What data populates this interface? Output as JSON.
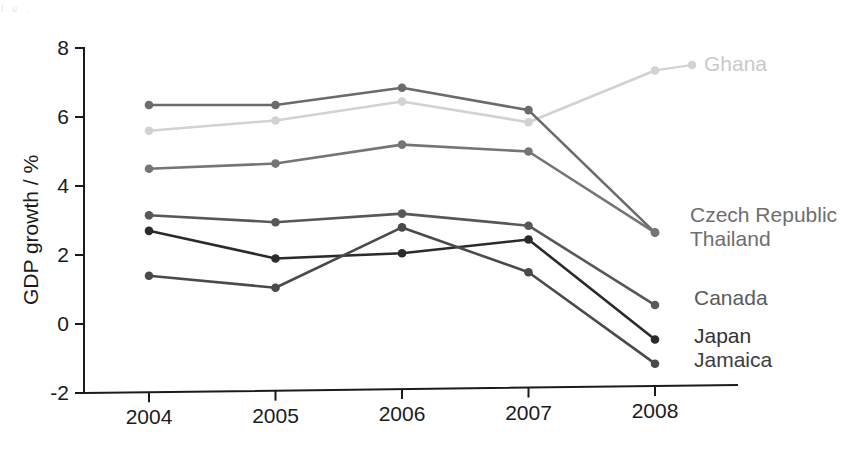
{
  "figure": {
    "background_color": "#ffffff",
    "top_artifact_text": "f    g                                                    ."
  },
  "axes": {
    "y_axis_title": "GDP growth / %",
    "y_ticks": [
      "8",
      "6",
      "4",
      "2",
      "0",
      "-2"
    ],
    "x_ticks": [
      "2004",
      "2005",
      "2006",
      "2007",
      "2008"
    ],
    "axis_color": "#1b1b1b"
  },
  "labels": [
    {
      "name": "Ghana",
      "text": "Ghana",
      "color": "#c9c9c9"
    },
    {
      "name": "Czech Republic",
      "text": "Czech Republic",
      "color": "#6e6e6e"
    },
    {
      "name": "Thailand",
      "text": "Thailand",
      "color": "#6e6e6e"
    },
    {
      "name": "Canada",
      "text": "Canada",
      "color": "#5a5a5a"
    },
    {
      "name": "Japan",
      "text": "Japan",
      "color": "#333333"
    },
    {
      "name": "Jamaica",
      "text": "Jamaica",
      "color": "#3d3d3d"
    }
  ],
  "chart_data": {
    "type": "line",
    "title": "",
    "xlabel": "",
    "ylabel": "GDP growth / %",
    "categories": [
      "2004",
      "2005",
      "2006",
      "2007",
      "2008"
    ],
    "x": [
      2004,
      2005,
      2006,
      2007,
      2008
    ],
    "ylim": [
      -2,
      8
    ],
    "yticks": [
      -2,
      0,
      2,
      4,
      6,
      8
    ],
    "grid": false,
    "legend_position": "right-inline-labels",
    "markers": true,
    "series": [
      {
        "name": "Ghana",
        "color": "#d2d2d2",
        "label_color": "#c9c9c9",
        "values": [
          5.6,
          5.9,
          6.45,
          5.85,
          7.35
        ]
      },
      {
        "name": "Thailand",
        "color": "#6b6b6b",
        "label_color": "#6e6e6e",
        "values": [
          6.35,
          6.35,
          6.85,
          6.2,
          2.65
        ]
      },
      {
        "name": "Czech Republic",
        "color": "#757575",
        "label_color": "#6e6e6e",
        "values": [
          4.5,
          4.65,
          5.2,
          5.0,
          2.65
        ]
      },
      {
        "name": "Canada",
        "color": "#585858",
        "label_color": "#5a5a5a",
        "values": [
          3.15,
          2.95,
          3.2,
          2.85,
          0.55
        ]
      },
      {
        "name": "Japan",
        "color": "#2b2b2b",
        "label_color": "#333333",
        "values": [
          2.7,
          1.9,
          2.05,
          2.45,
          -0.45
        ]
      },
      {
        "name": "Jamaica",
        "color": "#4a4a4a",
        "label_color": "#3d3d3d",
        "values": [
          1.4,
          1.05,
          2.8,
          1.5,
          -1.15
        ]
      }
    ]
  }
}
